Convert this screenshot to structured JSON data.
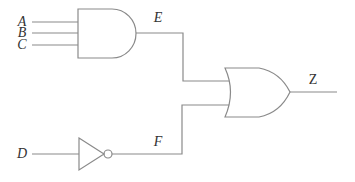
{
  "diagram": {
    "type": "logic-circuit",
    "stroke_color": "#8a8a8a",
    "label_color": "#333333",
    "inputs": [
      {
        "label": "A",
        "x": 22,
        "y": 22
      },
      {
        "label": "B",
        "x": 22,
        "y": 33
      },
      {
        "label": "C",
        "x": 22,
        "y": 45
      },
      {
        "label": "D",
        "x": 22,
        "y": 154
      }
    ],
    "gates": [
      {
        "id": "and1",
        "type": "AND",
        "inputs": [
          "A",
          "B",
          "C"
        ],
        "output": "E"
      },
      {
        "id": "not1",
        "type": "NOT",
        "inputs": [
          "D"
        ],
        "output": "F"
      },
      {
        "id": "or1",
        "type": "OR",
        "inputs": [
          "E",
          "F"
        ],
        "output": "Z"
      }
    ],
    "signals": [
      {
        "label": "E",
        "x": 158,
        "y": 18
      },
      {
        "label": "F",
        "x": 158,
        "y": 142
      },
      {
        "label": "Z",
        "x": 313,
        "y": 80
      }
    ]
  }
}
